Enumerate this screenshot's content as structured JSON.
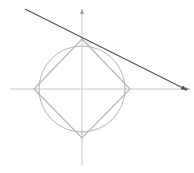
{
  "diagram": {
    "colors": {
      "background": "#ffffff",
      "axes": "#c8c8c8",
      "circle": "#b4b4b4",
      "square": "#b4b4b4",
      "tangent_line": "#505050"
    },
    "origin": {
      "x": 82,
      "y": 89
    },
    "axes": {
      "x_axis": {
        "x1": 10,
        "y1": 89,
        "x2": 190,
        "y2": 89,
        "arrow": "right"
      },
      "y_axis": {
        "x1": 82,
        "y1": 166,
        "x2": 82,
        "y2": 9,
        "arrow": "up"
      }
    },
    "circle": {
      "cx": 82,
      "cy": 89,
      "r": 43
    },
    "square": {
      "vertices": [
        {
          "x": 82,
          "y": 39
        },
        {
          "x": 130,
          "y": 89
        },
        {
          "x": 82,
          "y": 138
        },
        {
          "x": 34,
          "y": 89
        }
      ]
    },
    "tangent_line": {
      "x1": 25,
      "y1": 9,
      "x2": 187,
      "y2": 90
    }
  }
}
